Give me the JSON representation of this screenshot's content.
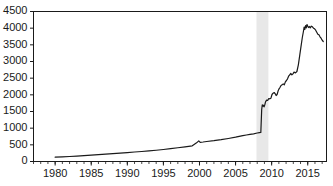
{
  "chart_data": {
    "type": "line",
    "title": "",
    "subtitle": "",
    "xlabel": "",
    "ylabel": "",
    "xlim": [
      1977.0,
      2017.6
    ],
    "ylim": [
      0,
      4500
    ],
    "grid": false,
    "legend": null,
    "y_ticks": [
      0,
      500,
      1000,
      1500,
      2000,
      2500,
      3000,
      3500,
      4000,
      4500
    ],
    "y_tick_labels": [
      "0",
      "500",
      "1000",
      "1500",
      "2000",
      "2500",
      "3000",
      "3500",
      "4000",
      "4500"
    ],
    "x_ticks_major": [
      1980,
      1985,
      1990,
      1995,
      2000,
      2005,
      2010,
      2015
    ],
    "x_tick_labels": [
      "1980",
      "1985",
      "1990",
      "1995",
      "2000",
      "2005",
      "2010",
      "2015"
    ],
    "x_minor_tick_step": 1,
    "line_color": "#1a1a1a",
    "line_width": 1.2,
    "shaded_regions": [
      {
        "name": "recession-band",
        "x_start": 2007.9,
        "x_end": 2009.55,
        "color": "#e8e8e8"
      }
    ],
    "series": [
      {
        "name": "series-1",
        "color": "#1a1a1a",
        "x": [
          1980.0,
          1981.0,
          1982.0,
          1983.0,
          1984.0,
          1985.0,
          1986.0,
          1987.0,
          1988.0,
          1989.0,
          1990.0,
          1991.0,
          1992.0,
          1993.0,
          1994.0,
          1995.0,
          1996.0,
          1997.0,
          1998.0,
          1999.0,
          1999.6,
          1999.9,
          2000.1,
          2000.5,
          2001.0,
          2002.0,
          2003.0,
          2004.0,
          2005.0,
          2006.0,
          2006.5,
          2007.0,
          2007.5,
          2008.0,
          2008.3,
          2008.5,
          2008.62,
          2008.7,
          2008.78,
          2008.85,
          2008.95,
          2009.05,
          2009.15,
          2009.3,
          2009.45,
          2009.6,
          2009.75,
          2009.9,
          2010.05,
          2010.2,
          2010.35,
          2010.5,
          2010.62,
          2010.75,
          2010.9,
          2011.0,
          2011.15,
          2011.3,
          2011.45,
          2011.6,
          2011.75,
          2011.9,
          2012.05,
          2012.2,
          2012.35,
          2012.5,
          2012.65,
          2012.8,
          2012.95,
          2013.1,
          2013.3,
          2013.5,
          2013.7,
          2013.9,
          2014.1,
          2014.25,
          2014.4,
          2014.5,
          2014.6,
          2014.7,
          2014.8,
          2014.9,
          2015.0,
          2015.1,
          2015.2,
          2015.35,
          2015.5,
          2015.65,
          2015.8,
          2015.95,
          2016.1,
          2016.25,
          2016.4,
          2016.55,
          2016.7,
          2016.85,
          2017.0,
          2017.15
        ],
        "y": [
          130,
          140,
          150,
          162,
          175,
          190,
          205,
          220,
          235,
          250,
          268,
          285,
          300,
          318,
          338,
          360,
          385,
          412,
          440,
          470,
          560,
          620,
          575,
          585,
          600,
          625,
          655,
          690,
          730,
          775,
          795,
          815,
          830,
          855,
          868,
          870,
          1560,
          1700,
          1660,
          1690,
          1640,
          1700,
          1790,
          1840,
          1830,
          1890,
          1880,
          1900,
          2010,
          2050,
          2070,
          2030,
          1980,
          2010,
          2120,
          2170,
          2220,
          2280,
          2300,
          2330,
          2300,
          2390,
          2430,
          2480,
          2560,
          2600,
          2640,
          2600,
          2630,
          2680,
          2660,
          2700,
          2900,
          3200,
          3500,
          3720,
          3900,
          4030,
          3960,
          4080,
          4010,
          4110,
          4060,
          4020,
          4050,
          4010,
          4060,
          4040,
          4000,
          3980,
          3940,
          3880,
          3820,
          3800,
          3740,
          3700,
          3640,
          3600
        ]
      }
    ]
  }
}
